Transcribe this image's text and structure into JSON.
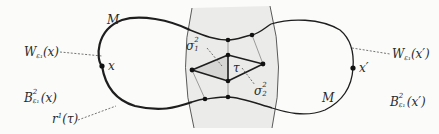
{
  "diagram": {
    "type": "manifold-neck-triangulation",
    "colors": {
      "curve": "#1e1e1e",
      "shade": "#e8e8e6",
      "triangle_fill": "#d2d2d0",
      "dashed_leader": "#3a3a3a",
      "background": "#fbfbfa"
    },
    "labels": {
      "M_left": "M",
      "M_right": "M",
      "x_left": "x",
      "x_right": "x′",
      "W_left": {
        "base": "W",
        "sub": "ε₁",
        "arg": "(x)"
      },
      "W_right": {
        "base": "W",
        "sub": "ε₁",
        "arg": "(x′)"
      },
      "B_left": {
        "base": "B",
        "sup": "2",
        "sub": "ε₁",
        "arg": "(x)"
      },
      "B_right": {
        "base": "B",
        "sup": "2",
        "sub": "ε₁",
        "arg": "(x′)"
      },
      "r_tau": {
        "base": "r",
        "sup": "1",
        "arg": "(τ)"
      },
      "sigma1": {
        "base": "σ",
        "sup": "2",
        "sub": "1"
      },
      "sigma2": {
        "base": "σ",
        "sup": "2",
        "sub": "2"
      },
      "tau": "τ"
    },
    "nodes": {
      "x": [
        102,
        66
      ],
      "x_prime": [
        353,
        68
      ],
      "neck_top": [
        228,
        40
      ],
      "neck_top_right": [
        252,
        35
      ],
      "diamond_top": [
        228,
        55
      ],
      "diamond_left": [
        192,
        70
      ],
      "diamond_right": [
        263,
        64
      ],
      "diamond_bottom": [
        228,
        81
      ],
      "neck_bottom": [
        228,
        97
      ],
      "neck_bottom_left": [
        205,
        99
      ]
    }
  }
}
